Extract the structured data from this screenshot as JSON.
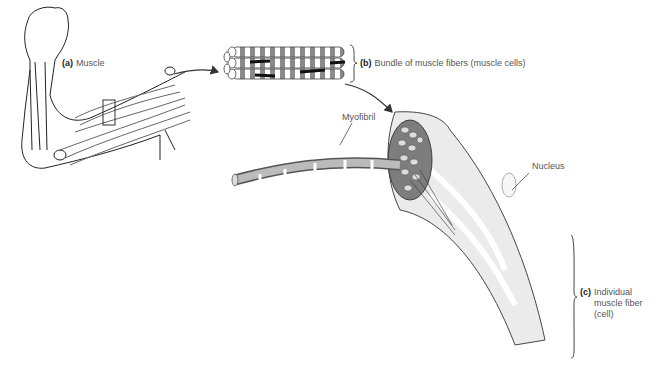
{
  "figure": {
    "labels": {
      "a": {
        "letter": "(a)",
        "text": "Muscle"
      },
      "b": {
        "letter": "(b)",
        "text": "Bundle of muscle fibers (muscle cells)"
      },
      "c": {
        "letter": "(c)",
        "text_line1": "Individual",
        "text_line2": "muscle fiber",
        "text_line3": "(cell)"
      },
      "myofibril": "Myofibril",
      "nucleus": "Nucleus"
    },
    "colors": {
      "ink": "#222222",
      "label_text": "#555555",
      "fiber_shade": "#e6e6e6",
      "band_dark": "#9a9a9a"
    }
  }
}
